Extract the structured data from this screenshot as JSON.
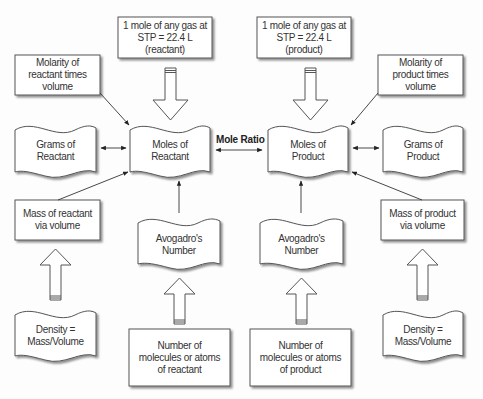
{
  "diagram": {
    "colors": {
      "stroke": "#555555",
      "fill": "#ffffff",
      "shadow": "#9a9a9a",
      "text": "#333333"
    },
    "center_label": "Mole Ratio",
    "nodes": {
      "stp_reactant": {
        "text": "1 mole of any gas at\nSTP = 22.4 L (reactant)",
        "shape": "box"
      },
      "stp_product": {
        "text": "1 mole of any gas at\nSTP = 22.4 L (product)",
        "shape": "box"
      },
      "molarity_reactant": {
        "text": "Molarity of\nreactant times volume",
        "shape": "box"
      },
      "molarity_product": {
        "text": "Molarity of\nproduct times volume",
        "shape": "box"
      },
      "grams_reactant": {
        "text": "Grams of\nReactant",
        "shape": "document"
      },
      "moles_reactant": {
        "text": "Moles of\nReactant",
        "shape": "document"
      },
      "moles_product": {
        "text": "Moles of\nProduct",
        "shape": "document"
      },
      "grams_product": {
        "text": "Grams of\nProduct",
        "shape": "document"
      },
      "mass_reactant": {
        "text": "Mass of reactant\nvia volume",
        "shape": "box"
      },
      "mass_product": {
        "text": "Mass of product\nvia volume",
        "shape": "box"
      },
      "avogadro_reactant": {
        "text": "Avogadro's\nNumber",
        "shape": "document"
      },
      "avogadro_product": {
        "text": "Avogadro's\nNumber",
        "shape": "document"
      },
      "density_reactant": {
        "text": "Density =\nMass/Volume",
        "shape": "document"
      },
      "density_product": {
        "text": "Density =\nMass/Volume",
        "shape": "document"
      },
      "count_reactant": {
        "text": "Number of\nmolecules or atoms\nof reactant",
        "shape": "box"
      },
      "count_product": {
        "text": "Number of\nmolecules or atoms\nof product",
        "shape": "box"
      }
    },
    "edges": [
      {
        "from": "stp_reactant",
        "to": "moles_reactant",
        "style": "block-arrow"
      },
      {
        "from": "stp_product",
        "to": "moles_product",
        "style": "block-arrow"
      },
      {
        "from": "molarity_reactant",
        "to": "moles_reactant",
        "style": "line-arrow"
      },
      {
        "from": "molarity_product",
        "to": "moles_product",
        "style": "line-arrow"
      },
      {
        "from": "grams_reactant",
        "to": "moles_reactant",
        "style": "double-arrow"
      },
      {
        "from": "moles_reactant",
        "to": "moles_product",
        "style": "double-arrow",
        "label": "Mole Ratio"
      },
      {
        "from": "moles_product",
        "to": "grams_product",
        "style": "double-arrow"
      },
      {
        "from": "mass_reactant",
        "to": "moles_reactant",
        "style": "line-arrow"
      },
      {
        "from": "mass_product",
        "to": "moles_product",
        "style": "line-arrow"
      },
      {
        "from": "avogadro_reactant",
        "to": "moles_reactant",
        "style": "line-arrow"
      },
      {
        "from": "avogadro_product",
        "to": "moles_product",
        "style": "line-arrow"
      },
      {
        "from": "density_reactant",
        "to": "mass_reactant",
        "style": "block-arrow"
      },
      {
        "from": "density_product",
        "to": "mass_product",
        "style": "block-arrow"
      },
      {
        "from": "count_reactant",
        "to": "avogadro_reactant",
        "style": "block-arrow"
      },
      {
        "from": "count_product",
        "to": "avogadro_product",
        "style": "block-arrow"
      }
    ]
  }
}
